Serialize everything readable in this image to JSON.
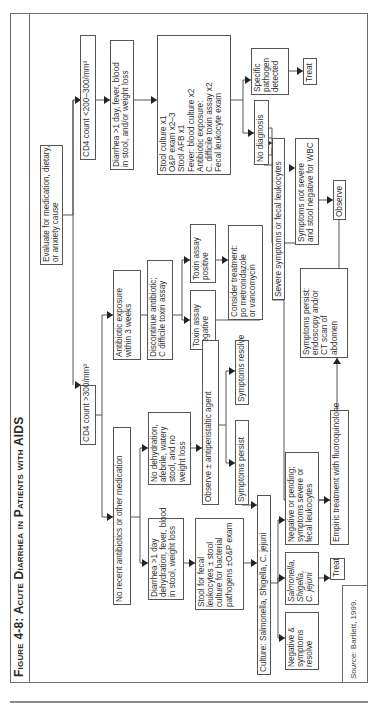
{
  "figure": {
    "title": "Figure 4-8: Acute Diarrhea in Patients with AIDS",
    "source_label": "Source:",
    "source_text": "Bartlett, 1999."
  },
  "nodes": {
    "evaluate": "Evaluate for medication, dietary,|or anxiety cause",
    "cd4_low": "CD4 count <200–300/mm³",
    "diarrhea_fever": "Diarrhea >1 day, fever, blood|in stool, and/or weight loss",
    "stool_workup": "Stool culture x1|O&P exam x2–3|Stool AFB x1|Fever: blood culture x2|Antibiotic exposure:|    C. difficile toxin assay x2|Fecal leukocyte exam",
    "specific_pathogen": "Specific|pathogen|detected",
    "treat_top": "Treat",
    "no_diagnosis": "No diagnosis",
    "severe_symptoms": "Severe symptoms or fecal leukocytes",
    "not_severe": "Symptoms not severe|and stool negative for WBC",
    "observe": "Observe",
    "persist_endoscopy": "Symptoms persist:|endoscopy and/or|CT scan of|abdomen",
    "cd4_high": "CD4 count >300/mm³",
    "antibiotic_exposure": "Antibiotic exposure|within 3 weeks",
    "discontinue": "Discontinue antibiotic;|C difficile toxin assay",
    "toxin_positive": "Toxin assay|positive",
    "toxin_negative": "Toxin assay|negative",
    "consider_treatment": "Consider treatment:|po metronidazole|or vancomycin",
    "symptoms_resolve": "Symptoms resolve",
    "no_recent_antibiotics": "No recent antibiotics or other medication",
    "no_dehydration": "No dehydration,|afebrile, watery|stool, and no|weight loss",
    "observe_antiperistaltic": "Observe ± antiperistaltic agent",
    "symptoms_persist": "Symptoms persist",
    "diarrhea_dehydration": "Diarrhea >1 day|dehydration, fever, blood|in stool, weight loss",
    "stool_fecal": "Stool for fecal|leukocytes ± stool|culture for bacterial|pathogens ±O&P exam",
    "culture": "Culture: Salmonella, Shigella, C. jejuni",
    "negative_resolve": "Negative &|symptoms|resolve",
    "salmonella": "Salmonella,|Shigella,|C. jejuni",
    "treat_bottom": "Treat",
    "negative_pending": "Negative or pending;|symptoms severe or|fecal leukocytes",
    "empiric": "Empiric treatment with fluoroquinolone"
  }
}
